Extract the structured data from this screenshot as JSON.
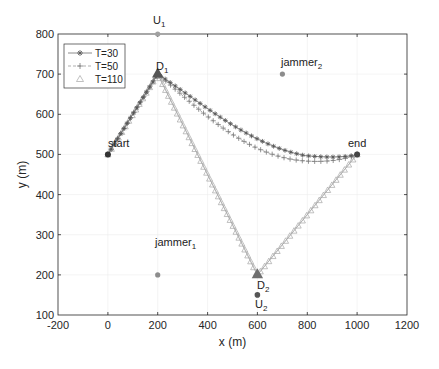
{
  "chart_data": {
    "type": "line",
    "title": "",
    "xlabel": "x (m)",
    "ylabel": "y (m)",
    "xlim": [
      -200,
      1200
    ],
    "ylim": [
      100,
      800
    ],
    "xticks": [
      -200,
      0,
      200,
      400,
      600,
      800,
      1000,
      1200
    ],
    "yticks": [
      100,
      200,
      300,
      400,
      500,
      600,
      700,
      800
    ],
    "grid": true,
    "legend_position": "upper-left",
    "legend": [
      "T=30",
      "T=50",
      "T=110"
    ],
    "series": [
      {
        "name": "T=30",
        "marker": "asterisk",
        "linestyle": "solid",
        "color": "#7f7f7f",
        "x": [
          0,
          50,
          100,
          150,
          200,
          300,
          400,
          500,
          600,
          700,
          800,
          850,
          900,
          950,
          1000
        ],
        "y": [
          500,
          550,
          600,
          650,
          700,
          643,
          590,
          550,
          522,
          503,
          495,
          494,
          495,
          497,
          500
        ]
      },
      {
        "name": "T=50",
        "marker": "plus",
        "linestyle": "dashed",
        "color": "#8c8c8c",
        "x": [
          0,
          50,
          100,
          150,
          200,
          300,
          400,
          500,
          600,
          700,
          780,
          850,
          900,
          950,
          1000
        ],
        "y": [
          500,
          550,
          600,
          650,
          700,
          625,
          565,
          520,
          492,
          478,
          474,
          477,
          483,
          491,
          500
        ]
      },
      {
        "name": "T=110",
        "marker": "triangle",
        "linestyle": "solid",
        "color": "#a6a6a6",
        "x": [
          0,
          100,
          200,
          300,
          400,
          500,
          600,
          700,
          800,
          900,
          1000
        ],
        "y": [
          500,
          600,
          700,
          575,
          450,
          325,
          200,
          260,
          350,
          425,
          500
        ]
      }
    ],
    "points": [
      {
        "label": "start",
        "x": 0,
        "y": 500,
        "marker": "dot"
      },
      {
        "label": "end",
        "x": 1000,
        "y": 500,
        "marker": "dot"
      },
      {
        "label": "D",
        "sub": "1",
        "x": 200,
        "y": 700,
        "marker": "filled-triangle"
      },
      {
        "label": "D",
        "sub": "2",
        "x": 600,
        "y": 200,
        "marker": "filled-triangle"
      },
      {
        "label": "U",
        "sub": "1",
        "x": 200,
        "y": 800,
        "marker": "dot"
      },
      {
        "label": "U",
        "sub": "2",
        "x": 600,
        "y": 150,
        "marker": "dot"
      },
      {
        "label": "jammer",
        "sub": "1",
        "x": 200,
        "y": 200,
        "marker": "dot"
      },
      {
        "label": "jammer",
        "sub": "2",
        "x": 700,
        "y": 700,
        "marker": "dot"
      }
    ]
  },
  "labels": {
    "xlabel": "x (m)",
    "ylabel": "y (m)",
    "legend": [
      "T=30",
      "T=50",
      "T=110"
    ],
    "start": "start",
    "end": "end",
    "D": "D",
    "U": "U",
    "jammer": "jammer",
    "sub1": "1",
    "sub2": "2",
    "xticks": [
      "-200",
      "0",
      "200",
      "400",
      "600",
      "800",
      "1000",
      "1200"
    ],
    "yticks": [
      "800",
      "700",
      "600",
      "500",
      "400",
      "300",
      "200",
      "100"
    ]
  }
}
